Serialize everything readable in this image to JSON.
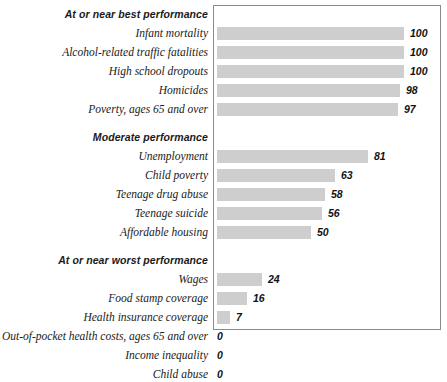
{
  "chart_data": {
    "type": "bar",
    "orientation": "horizontal",
    "title": "",
    "subtitle": "",
    "xlabel": "",
    "ylabel": "",
    "xlim": [
      0,
      100
    ],
    "grid": false,
    "legend": null,
    "bar_color": "#cecece",
    "frame_color": "#8a8a8a",
    "groups": [
      {
        "label": "At or near best performance",
        "items": [
          {
            "label": "Infant mortality",
            "value": 100,
            "display": "100"
          },
          {
            "label": "Alcohol-related traffic fatalities",
            "value": 100,
            "display": "100"
          },
          {
            "label": "High school dropouts",
            "value": 100,
            "display": "100"
          },
          {
            "label": "Homicides",
            "value": 98,
            "display": "98"
          },
          {
            "label": "Poverty, ages 65 and over",
            "value": 97,
            "display": "97"
          }
        ]
      },
      {
        "label": "Moderate performance",
        "items": [
          {
            "label": "Unemployment",
            "value": 81,
            "display": "81"
          },
          {
            "label": "Child poverty",
            "value": 63,
            "display": "63"
          },
          {
            "label": "Teenage drug abuse",
            "value": 58,
            "display": "58"
          },
          {
            "label": "Teenage suicide",
            "value": 56,
            "display": "56"
          },
          {
            "label": "Affordable housing",
            "value": 50,
            "display": "50"
          }
        ]
      },
      {
        "label": "At or near worst performance",
        "items": [
          {
            "label": "Wages",
            "value": 24,
            "display": "24"
          },
          {
            "label": "Food stamp coverage",
            "value": 16,
            "display": "16"
          },
          {
            "label": "Health insurance coverage",
            "value": 7,
            "display": "7"
          },
          {
            "label": "Out-of-pocket health costs, ages 65 and over",
            "value": 0,
            "display": "0"
          },
          {
            "label": "Income inequality",
            "value": 0,
            "display": "0"
          },
          {
            "label": "Child abuse",
            "value": 0,
            "display": "0"
          }
        ]
      }
    ],
    "categories": [
      "Infant mortality",
      "Alcohol-related traffic fatalities",
      "High school dropouts",
      "Homicides",
      "Poverty, ages 65 and over",
      "Unemployment",
      "Child poverty",
      "Teenage drug abuse",
      "Teenage suicide",
      "Affordable housing",
      "Wages",
      "Food stamp coverage",
      "Health insurance coverage",
      "Out-of-pocket health costs, ages 65 and over",
      "Income inequality",
      "Child abuse"
    ],
    "values": [
      100,
      100,
      100,
      98,
      97,
      81,
      63,
      58,
      56,
      50,
      24,
      16,
      7,
      0,
      0,
      0
    ]
  }
}
